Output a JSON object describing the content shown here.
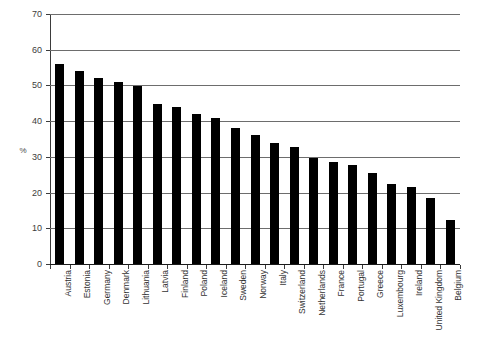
{
  "chart_data": {
    "type": "bar",
    "title": "",
    "subtitle": "",
    "xlabel": "",
    "ylabel": "%",
    "ylim": [
      0,
      70
    ],
    "yticks": [
      0,
      10,
      20,
      30,
      40,
      50,
      60,
      70
    ],
    "grid": true,
    "legend": null,
    "bar_color": "#000000",
    "categories": [
      "Austria",
      "Estonia",
      "Germany",
      "Denmark",
      "Lithuania",
      "Latvia",
      "Finland",
      "Poland",
      "Iceland",
      "Sweden",
      "Norway",
      "Italy",
      "Switzerland",
      "Netherlands",
      "France",
      "Portugal",
      "Greece",
      "Luxembourg",
      "Ireland",
      "United Kingdom",
      "Belgium"
    ],
    "values": [
      56.0,
      54.0,
      52.0,
      51.0,
      49.8,
      44.8,
      44.0,
      42.0,
      40.8,
      38.0,
      36.0,
      33.8,
      32.8,
      29.8,
      28.7,
      27.6,
      25.6,
      22.4,
      21.5,
      18.5,
      12.3
    ]
  },
  "axis": {
    "ytick_labels": [
      "0",
      "10",
      "20",
      "30",
      "40",
      "50",
      "60",
      "70"
    ]
  }
}
